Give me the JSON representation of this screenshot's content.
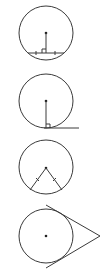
{
  "diagram": {
    "title": "",
    "stroke_color": "#3a3a3a",
    "background": "#ffffff",
    "figures": [
      {
        "id": "perpendicular-to-chord",
        "description": "Circle with radius perpendicular to a chord, bisecting it (tick marks on each half, right-angle marker)",
        "circle": {
          "cx": 46,
          "cy": 33,
          "r": 27
        },
        "center": [
          46,
          33
        ],
        "radius_segment": [
          [
            46,
            33
          ],
          [
            46,
            53
          ]
        ],
        "chord": [
          [
            28,
            53
          ],
          [
            64,
            53
          ]
        ],
        "right_angle": true,
        "tick_marks": 2
      },
      {
        "id": "radius-perpendicular-to-tangent",
        "description": "Circle with radius perpendicular to tangent line at point of tangency",
        "circle": {
          "cx": 46,
          "cy": 101,
          "r": 27
        },
        "center": [
          46,
          101
        ],
        "radius_segment": [
          [
            46,
            101
          ],
          [
            46,
            128
          ]
        ],
        "tangent_line": [
          [
            44,
            128
          ],
          [
            79,
            128
          ]
        ],
        "right_angle": true
      },
      {
        "id": "equal-chords-from-center",
        "description": "Circle with two congruent segments from center to circumference (tick marks)",
        "circle": {
          "cx": 46,
          "cy": 167,
          "r": 27
        },
        "center": [
          46,
          168
        ],
        "segments": [
          [
            [
              46,
              168
            ],
            [
              30,
              190
            ]
          ],
          [
            [
              46,
              168
            ],
            [
              62,
              190
            ]
          ]
        ],
        "tick_marks": 2
      },
      {
        "id": "two-tangents-from-external-point",
        "description": "Circle with two tangent lines from an external point",
        "circle": {
          "cx": 46,
          "cy": 236,
          "r": 27
        },
        "center": [
          46,
          236
        ],
        "external_point": [
          100,
          236
        ],
        "tangent_lines": [
          [
            [
              46,
              205
            ],
            [
              100,
              236
            ]
          ],
          [
            [
              46,
              268
            ],
            [
              100,
              236
            ]
          ]
        ]
      }
    ]
  }
}
